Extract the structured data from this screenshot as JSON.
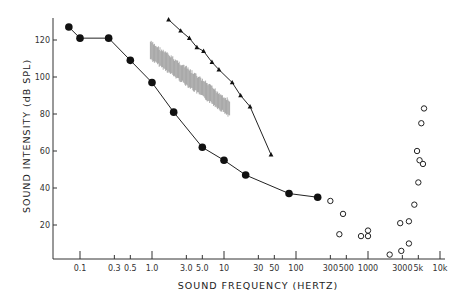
{
  "chart_data": {
    "type": "scatter",
    "title": "",
    "xlabel": "SOUND FREQUENCY (HERTZ)",
    "ylabel": "SOUND INTENSITY (dB SPL)",
    "xscale": "log",
    "xlim": [
      0.05,
      10000
    ],
    "ylim": [
      0,
      130
    ],
    "grid": false,
    "legend": "none",
    "x_ticks": [
      {
        "v": 0.1,
        "label": "0.1"
      },
      {
        "v": 0.3,
        "label": "0.3"
      },
      {
        "v": 0.5,
        "label": "0.5"
      },
      {
        "v": 1,
        "label": "1.0"
      },
      {
        "v": 3,
        "label": "3.0"
      },
      {
        "v": 5,
        "label": "5.0"
      },
      {
        "v": 10,
        "label": "10"
      },
      {
        "v": 30,
        "label": "30"
      },
      {
        "v": 50,
        "label": "50"
      },
      {
        "v": 100,
        "label": "100"
      },
      {
        "v": 300,
        "label": "300"
      },
      {
        "v": 500,
        "label": "500"
      },
      {
        "v": 1000,
        "label": "1000"
      },
      {
        "v": 3000,
        "label": "3000"
      },
      {
        "v": 5000,
        "label": "5k"
      },
      {
        "v": 10000,
        "label": "10k"
      }
    ],
    "y_ticks": [
      {
        "v": 20,
        "label": "20"
      },
      {
        "v": 40,
        "label": "40"
      },
      {
        "v": 60,
        "label": "60"
      },
      {
        "v": 80,
        "label": "80"
      },
      {
        "v": 100,
        "label": "100"
      },
      {
        "v": 120,
        "label": "120"
      }
    ],
    "series": [
      {
        "name": "filled-circles",
        "marker": "filled-circle",
        "line": true,
        "points": [
          [
            0.07,
            127
          ],
          [
            0.1,
            121
          ],
          [
            0.25,
            121
          ],
          [
            0.5,
            109
          ],
          [
            1.0,
            97
          ],
          [
            2.0,
            81
          ],
          [
            5.0,
            62
          ],
          [
            10,
            55
          ],
          [
            20,
            47
          ],
          [
            80,
            37
          ],
          [
            200,
            35
          ]
        ]
      },
      {
        "name": "triangles",
        "marker": "filled-triangle",
        "line": true,
        "points": [
          [
            1.7,
            131
          ],
          [
            2.5,
            125
          ],
          [
            3.3,
            121
          ],
          [
            4.2,
            116
          ],
          [
            5.2,
            114
          ],
          [
            6.8,
            108
          ],
          [
            8.5,
            104
          ],
          [
            13,
            97
          ],
          [
            17,
            90
          ],
          [
            23,
            84
          ],
          [
            45,
            58
          ]
        ]
      },
      {
        "name": "gray-band",
        "marker": "shaded-band",
        "line": false,
        "upper": [
          [
            0.95,
            119
          ],
          [
            3,
            105
          ],
          [
            12,
            87
          ]
        ],
        "lower": [
          [
            0.95,
            110
          ],
          [
            3,
            96
          ],
          [
            12,
            79
          ]
        ]
      },
      {
        "name": "open-circles",
        "marker": "open-circle",
        "line": false,
        "points": [
          [
            300,
            33
          ],
          [
            450,
            26
          ],
          [
            400,
            15
          ],
          [
            800,
            14
          ],
          [
            1000,
            17
          ],
          [
            1000,
            14
          ],
          [
            2000,
            4
          ],
          [
            2800,
            21
          ],
          [
            2900,
            6
          ],
          [
            3700,
            22
          ],
          [
            3700,
            10
          ],
          [
            4400,
            31
          ],
          [
            5000,
            43
          ],
          [
            5200,
            55
          ],
          [
            5800,
            53
          ],
          [
            4800,
            60
          ],
          [
            5500,
            75
          ],
          [
            6000,
            83
          ]
        ]
      }
    ]
  }
}
